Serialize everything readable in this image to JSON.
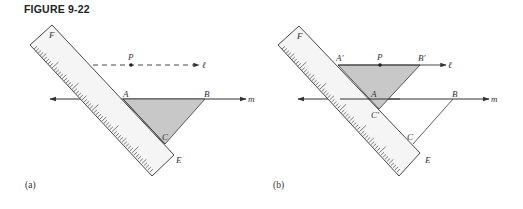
{
  "figure": {
    "title": "FIGURE 9-22",
    "panels": [
      {
        "caption": "(a)",
        "labels": {
          "F": "F",
          "P": "P",
          "l": "ℓ",
          "A": "A",
          "B": "B",
          "m": "m",
          "C": "C",
          "E": "E"
        }
      },
      {
        "caption": "(b)",
        "labels": {
          "F": "F",
          "A1": "A′",
          "P": "P",
          "B1": "B′",
          "l": "ℓ",
          "A": "A",
          "B": "B",
          "m": "m",
          "C1": "C′",
          "C": "C",
          "E": "E"
        }
      }
    ],
    "colors": {
      "triangle_fill": "#c8c8c8",
      "ruler_fill": "#f4f4f4",
      "stroke": "#333333"
    }
  }
}
